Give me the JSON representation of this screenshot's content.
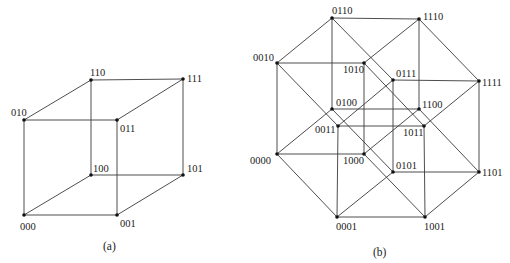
{
  "figures": [
    {
      "id": "a",
      "caption": "(a)",
      "caption_pos": [
        103,
        250
      ],
      "title": "3-cube",
      "vertices": [
        {
          "label": "000",
          "x": 24,
          "y": 215,
          "lx": 20,
          "ly": 230
        },
        {
          "label": "001",
          "x": 117,
          "y": 215,
          "lx": 120,
          "ly": 227
        },
        {
          "label": "010",
          "x": 24,
          "y": 120,
          "lx": 11,
          "ly": 116
        },
        {
          "label": "011",
          "x": 117,
          "y": 120,
          "lx": 120,
          "ly": 132
        },
        {
          "label": "100",
          "x": 91,
          "y": 175,
          "lx": 93,
          "ly": 172
        },
        {
          "label": "101",
          "x": 183,
          "y": 175,
          "lx": 187,
          "ly": 172
        },
        {
          "label": "110",
          "x": 91,
          "y": 80,
          "lx": 90,
          "ly": 76
        },
        {
          "label": "111",
          "x": 183,
          "y": 79,
          "lx": 187,
          "ly": 82
        }
      ]
    },
    {
      "id": "b",
      "caption": "(b)",
      "caption_pos": [
        373,
        256
      ],
      "title": "4-cube",
      "vertices": [
        {
          "label": "0000",
          "x": 277,
          "y": 154,
          "lx": 250,
          "ly": 164
        },
        {
          "label": "0001",
          "x": 337,
          "y": 217,
          "lx": 336,
          "ly": 230
        },
        {
          "label": "0010",
          "x": 277,
          "y": 63,
          "lx": 253,
          "ly": 61
        },
        {
          "label": "0011",
          "x": 338,
          "y": 126,
          "lx": 315,
          "ly": 133
        },
        {
          "label": "0100",
          "x": 332,
          "y": 109,
          "lx": 336,
          "ly": 106
        },
        {
          "label": "0101",
          "x": 393,
          "y": 172,
          "lx": 396,
          "ly": 169
        },
        {
          "label": "0110",
          "x": 332,
          "y": 18,
          "lx": 332,
          "ly": 14
        },
        {
          "label": "0111",
          "x": 393,
          "y": 80,
          "lx": 396,
          "ly": 77
        },
        {
          "label": "1000",
          "x": 364,
          "y": 154,
          "lx": 343,
          "ly": 164
        },
        {
          "label": "1001",
          "x": 425,
          "y": 217,
          "lx": 424,
          "ly": 230
        },
        {
          "label": "1010",
          "x": 364,
          "y": 63,
          "lx": 343,
          "ly": 73
        },
        {
          "label": "1011",
          "x": 424,
          "y": 126,
          "lx": 403,
          "ly": 136
        },
        {
          "label": "1100",
          "x": 419,
          "y": 109,
          "lx": 422,
          "ly": 108
        },
        {
          "label": "1101",
          "x": 479,
          "y": 172,
          "lx": 482,
          "ly": 176
        },
        {
          "label": "1110",
          "x": 419,
          "y": 19,
          "lx": 423,
          "ly": 20
        },
        {
          "label": "1111",
          "x": 479,
          "y": 81,
          "lx": 482,
          "ly": 86
        }
      ]
    }
  ]
}
